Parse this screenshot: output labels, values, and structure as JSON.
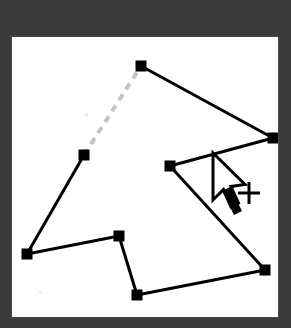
{
  "app": {
    "title": "Polygon Drawing Canvas",
    "chrome_color": "#3b3b3b",
    "canvas_background": "#ffffff",
    "canvas_border_color": "#4a4a4a"
  },
  "canvas": {
    "width": 268,
    "height": 282,
    "origin_x": 11,
    "origin_y": 36
  },
  "drawing": {
    "shape_name": "polygon",
    "stroke_color": "#000000",
    "stroke_width": 3,
    "vertex_color": "#000000",
    "vertex_size": 11,
    "vertex_count": 8,
    "closed": false,
    "vertices": [
      {
        "label": "vertex-1-top",
        "x": 129,
        "y": 29
      },
      {
        "label": "vertex-2-right",
        "x": 261,
        "y": 101
      },
      {
        "label": "vertex-3-mid-right",
        "x": 158,
        "y": 129
      },
      {
        "label": "vertex-4-bottom-right",
        "x": 253,
        "y": 233
      },
      {
        "label": "vertex-5-bottom",
        "x": 125,
        "y": 258
      },
      {
        "label": "vertex-6-mid-bottom",
        "x": 107,
        "y": 199
      },
      {
        "label": "vertex-7-lower-left",
        "x": 15,
        "y": 217
      },
      {
        "label": "vertex-8-left-mid",
        "x": 72,
        "y": 118
      }
    ],
    "solid_edges": [
      {
        "label": "edge-1-2",
        "from": 0,
        "to": 1
      },
      {
        "label": "edge-2-3",
        "from": 1,
        "to": 2
      },
      {
        "label": "edge-3-4",
        "from": 2,
        "to": 3
      },
      {
        "label": "edge-4-5",
        "from": 3,
        "to": 4
      },
      {
        "label": "edge-5-6",
        "from": 4,
        "to": 5
      },
      {
        "label": "edge-6-7",
        "from": 5,
        "to": 6
      },
      {
        "label": "edge-7-8",
        "from": 6,
        "to": 7
      }
    ],
    "pending_edge": {
      "label": "edge-8-1-pending",
      "from": 7,
      "to": 0,
      "style": "dashed",
      "color": "#c4c4c4",
      "dash_pattern": "7 6",
      "stroke_width": 4
    }
  },
  "cursor": {
    "pointer_icon": "arrow-pointer-icon",
    "tip_x": 201,
    "tip_y": 116,
    "crosshair_icon": "plus-crosshair-icon",
    "crosshair_label": "+",
    "crosshair_x": 236,
    "crosshair_y": 156,
    "fill": "#ffffff",
    "outline": "#000000"
  }
}
